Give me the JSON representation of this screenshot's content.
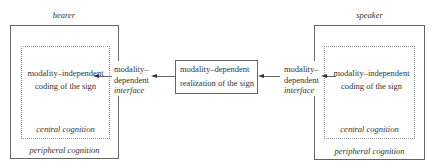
{
  "hearer": {
    "title": "hearer",
    "inner_text_line1": "modality–independent",
    "inner_text_line2": "coding of the sign",
    "central_label": "central cognition",
    "peripheral_label": "peripheral cognition",
    "interface_line1": "modality–",
    "interface_line2": "dependent",
    "interface_line3": "interface"
  },
  "middle": {
    "line1": "modality–dependent",
    "line2": "realization of the sign"
  },
  "speaker": {
    "title": "speaker",
    "inner_text_line1": "modality–independent",
    "inner_text_line2": "coding of the sign",
    "central_label": "central cognition",
    "peripheral_label": "peripheral cognition",
    "interface_line1": "modality–",
    "interface_line2": "dependent",
    "interface_line3": "interface"
  }
}
